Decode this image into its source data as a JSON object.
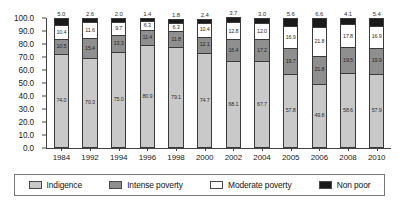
{
  "chart_data": {
    "type": "bar",
    "subtype": "stacked-bar-100-percent",
    "title": "",
    "subtitle": "",
    "xlabel": "",
    "ylabel": "",
    "ylim": [
      0.0,
      100.0
    ],
    "y_ticks": [
      "0.0",
      "10.0",
      "20.0",
      "30.0",
      "40.0",
      "50.0",
      "60.0",
      "70.0",
      "80.0",
      "90.0",
      "100.0"
    ],
    "grid": false,
    "legend_position": "bottom",
    "categories": [
      "1984",
      "1992",
      "1994",
      "1996",
      "1998",
      "2000",
      "2002",
      "2004",
      "2005",
      "2006",
      "2008",
      "2010"
    ],
    "series": [
      {
        "name": "Indigence",
        "color": "#c9c9c9",
        "values": [
          74.0,
          70.3,
          75.0,
          80.9,
          79.1,
          74.7,
          68.1,
          67.7,
          57.8,
          49.8,
          58.6,
          57.9
        ]
      },
      {
        "name": "Intense poverty",
        "color": "#8f8f8f",
        "values": [
          10.5,
          15.4,
          13.3,
          11.4,
          11.8,
          12.1,
          16.4,
          17.2,
          19.7,
          21.8,
          19.5,
          19.9
        ]
      },
      {
        "name": "Moderate poverty",
        "color": "#ffffff",
        "values": [
          10.4,
          11.6,
          9.7,
          6.3,
          6.3,
          10.4,
          12.8,
          12.0,
          16.9,
          21.8,
          17.8,
          16.9
        ]
      },
      {
        "name": "Non poor",
        "color": "#1a1a1a",
        "values": [
          5.0,
          2.6,
          2.0,
          1.4,
          1.8,
          2.4,
          3.7,
          3.0,
          5.6,
          6.6,
          4.1,
          5.4
        ]
      }
    ]
  },
  "legend": {
    "items": [
      {
        "label": "Indigence",
        "color": "#c9c9c9"
      },
      {
        "label": "Intense poverty",
        "color": "#8f8f8f"
      },
      {
        "label": "Moderate poverty",
        "color": "#ffffff"
      },
      {
        "label": "Non poor",
        "color": "#1a1a1a"
      }
    ]
  }
}
